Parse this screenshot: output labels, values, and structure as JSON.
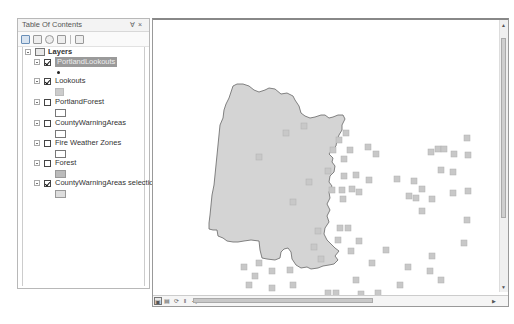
{
  "toc": {
    "title": "Table Of Contents",
    "controls": "Ɐ ×",
    "toolbar": [
      {
        "name": "list-by-drawing-order",
        "active": true
      },
      {
        "name": "list-by-source",
        "active": false
      },
      {
        "name": "list-by-visibility",
        "active": false
      },
      {
        "name": "list-by-selection",
        "active": false
      },
      {
        "name": "options",
        "active": false
      }
    ],
    "root": {
      "label": "Layers"
    },
    "layers": [
      {
        "label": "PortlandLookouts",
        "checked": true,
        "selected": true,
        "symbol": "dot"
      },
      {
        "label": "Lookouts",
        "checked": true,
        "selected": false,
        "symbol": "square"
      },
      {
        "label": "PortlandForest",
        "checked": false,
        "selected": false,
        "symbol": "hollow-rect"
      },
      {
        "label": "CountyWarningAreas",
        "checked": false,
        "selected": false,
        "symbol": "hollow-rect"
      },
      {
        "label": "Fire Weather Zones",
        "checked": false,
        "selected": false,
        "symbol": "hollow-rect"
      },
      {
        "label": "Forest",
        "checked": false,
        "selected": false,
        "symbol": "gray-rect"
      },
      {
        "label": "CountyWarningAreas selection",
        "checked": true,
        "selected": false,
        "symbol": "light-rect"
      }
    ]
  },
  "map": {
    "polygon_fill": "#d4d4d4",
    "polygon_stroke": "#666666",
    "point_fill": "#c8c8c8",
    "status_buttons": [
      "data-view",
      "layout-view",
      "refresh",
      "pause",
      "scroll-left"
    ]
  }
}
